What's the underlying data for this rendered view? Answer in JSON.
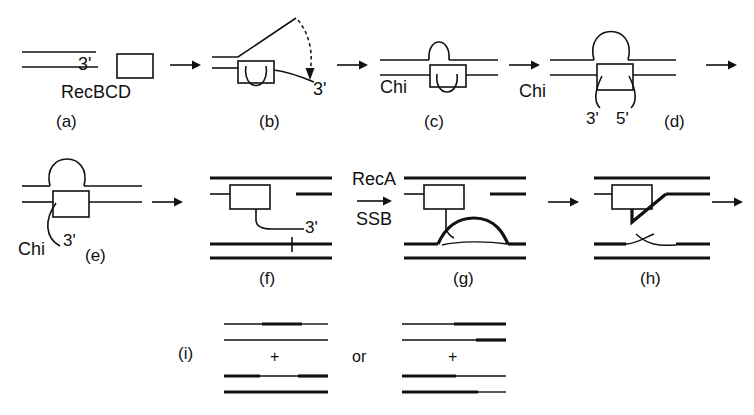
{
  "figure": {
    "type": "diagram",
    "panels": [
      {
        "id": "a",
        "caption": "(a)",
        "labels": [
          "3'",
          "RecBCD"
        ],
        "description": "Linear duplex DNA with blunt/3' end and RecBCD enzyme box"
      },
      {
        "id": "b",
        "caption": "(b)",
        "labels": [
          "3'"
        ],
        "description": "RecBCD loads and unwinds DNA producing loop and 3' tail, dashed arrow shows degradation"
      },
      {
        "id": "c",
        "caption": "(c)",
        "labels": [
          "Chi"
        ],
        "description": "Translocating enzyme with twin loops approaching Chi site"
      },
      {
        "id": "d",
        "caption": "(d)",
        "labels": [
          "Chi",
          "3'",
          "5'"
        ],
        "description": "Enzyme at Chi site with large loop above and 3' and 5' tails below"
      },
      {
        "id": "e",
        "caption": "(e)",
        "labels": [
          "Chi",
          "3'"
        ],
        "description": "After Chi recognition only the 3'-ended strand persists"
      },
      {
        "id": "f",
        "caption": "(f)",
        "labels": [
          "3'"
        ],
        "description": "3' single-strand tail presented to homologous duplex DNA"
      },
      {
        "id": "g",
        "caption": "(g)",
        "labels": [],
        "description": "Strand invasion forming a D-loop"
      },
      {
        "id": "h",
        "caption": "(h)",
        "labels": [],
        "description": "Holliday junction / crossover intermediate"
      },
      {
        "id": "i",
        "caption": "(i)",
        "labels": [
          "+",
          "or",
          "+"
        ],
        "description": "Two alternative resolution products: patch (non-crossover) or splice (crossover)"
      }
    ],
    "reaction_labels": [
      {
        "id": "reca",
        "text": "RecA"
      },
      {
        "id": "ssb",
        "text": "SSB"
      }
    ],
    "connector": "arrow-right",
    "colors": {
      "ink": "#111111",
      "background": "#ffffff"
    }
  },
  "captions": {
    "a": "(a)",
    "b": "(b)",
    "c": "(c)",
    "d": "(d)",
    "e": "(e)",
    "f": "(f)",
    "g": "(g)",
    "h": "(h)",
    "i": "(i)"
  },
  "text": {
    "recbcd": "RecBCD",
    "reca": "RecA",
    "ssb": "SSB",
    "chi": "Chi",
    "three_prime": "3'",
    "five_prime": "5'",
    "plus": "+",
    "or": "or"
  }
}
